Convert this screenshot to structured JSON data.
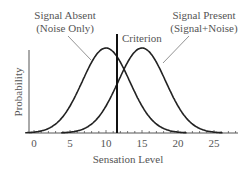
{
  "chart_data": {
    "type": "line",
    "title": "",
    "xlabel": "Sensation Level",
    "ylabel": "Probability",
    "xlim": [
      -1,
      28
    ],
    "x_ticks": [
      0,
      5,
      10,
      15,
      20,
      25
    ],
    "x_tick_labels": [
      "0",
      "5",
      "10",
      "15",
      "20",
      "25"
    ],
    "grid": false,
    "series": [
      {
        "name": "Signal Absent (Noise Only)",
        "distribution": "normal",
        "mean": 10,
        "sd": 3.3
      },
      {
        "name": "Signal Present (Signal+Noise)",
        "distribution": "normal",
        "mean": 15,
        "sd": 3.3
      }
    ],
    "annotations": [
      {
        "text_line1": "Signal Absent",
        "text_line2": "(Noise Only)"
      },
      {
        "text_line1": "Signal Present",
        "text_line2": "(Signal+Noise)"
      },
      {
        "text": "Criterion",
        "x": 11.5
      }
    ]
  },
  "labels": {
    "absent_1": "Signal Absent",
    "absent_2": "(Noise Only)",
    "present_1": "Signal Present",
    "present_2": "(Signal+Noise)",
    "criterion": "Criterion",
    "xlabel": "Sensation Level",
    "ylabel": "Probability",
    "ticks": [
      "0",
      "5",
      "10",
      "15",
      "20",
      "25"
    ]
  },
  "colors": {
    "curve": "#222222",
    "axis": "#555555",
    "text": "#555555"
  }
}
